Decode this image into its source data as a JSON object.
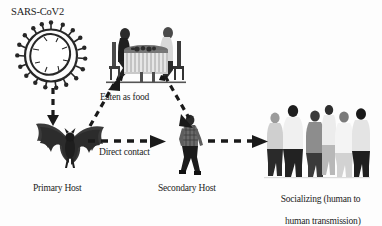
{
  "figure": {
    "title": "SARS-CoV2",
    "background_color": "#fdfdfd",
    "ink_color": "#1c1c1c"
  },
  "nodes": {
    "virus": {
      "icon": "coronavirus-particle-icon",
      "label": "SARS-CoV2"
    },
    "primary_host": {
      "icon": "bat-icon",
      "label": "Primary Host"
    },
    "dining": {
      "icon": "people-dining-at-table-icon",
      "label": ""
    },
    "secondary_host": {
      "icon": "walking-person-icon",
      "label": "Secondary Host"
    },
    "group": {
      "icon": "group-of-people-socializing-icon",
      "label_line1": "Socializing (human to",
      "label_line2": "human transmission)"
    }
  },
  "edges": {
    "virus_to_bat": {
      "label": "",
      "style": "dashed-arrow-down"
    },
    "bat_to_table": {
      "label": "Eaten as food",
      "style": "dashed-arrow-diagonal-up-right"
    },
    "table_to_secondary": {
      "label": "",
      "style": "dashed-arrow-diagonal-down-right"
    },
    "bat_to_secondary": {
      "label": "Direct contact",
      "style": "dashed-arrow-right"
    },
    "secondary_to_group": {
      "label": "",
      "style": "dashed-arrow-right"
    }
  }
}
